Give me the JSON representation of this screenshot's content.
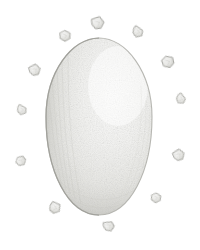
{
  "illustration": {
    "title": "Egg with scattered shell fragments",
    "medium": "pencil sketch",
    "background_color": "#ffffff",
    "caption": "",
    "subject_label": "egg",
    "fragments_label": "shell fragment"
  },
  "canvas": {
    "width": 200,
    "height": 250
  },
  "palette": {
    "background": "#ffffff",
    "egg_highlight": "#fcfcfb",
    "egg_midtone": "#e9e9e6",
    "egg_shadow": "#c9c9c5",
    "egg_outline": "#b3b3ae",
    "fragment_fill": "#ededea",
    "fragment_outline": "#a9a9a4",
    "texture_speckle": "#d6d6d2"
  },
  "egg": {
    "center_x": 99,
    "center_y": 127,
    "radius_x": 53,
    "radius_y": 89,
    "taper_top": 0.74,
    "light_direction": "upper-right",
    "outline_width": 1.1
  },
  "fragments": [
    {
      "id": "frag-top",
      "cx": 98,
      "cy": 23,
      "size": 11,
      "rot": -12,
      "shape": "chip-a"
    },
    {
      "id": "frag-top-right",
      "cx": 138,
      "cy": 32,
      "size": 10,
      "rot": 24,
      "shape": "chip-b"
    },
    {
      "id": "frag-right-upper",
      "cx": 168,
      "cy": 62,
      "size": 11,
      "rot": -8,
      "shape": "chip-c"
    },
    {
      "id": "frag-right",
      "cx": 181,
      "cy": 99,
      "size": 9,
      "rot": 40,
      "shape": "chip-b"
    },
    {
      "id": "frag-right-lower",
      "cx": 179,
      "cy": 155,
      "size": 10,
      "rot": -26,
      "shape": "chip-a"
    },
    {
      "id": "frag-bottom-right",
      "cx": 156,
      "cy": 198,
      "size": 9,
      "rot": 14,
      "shape": "chip-c"
    },
    {
      "id": "frag-bottom",
      "cx": 109,
      "cy": 226,
      "size": 10,
      "rot": -18,
      "shape": "chip-b"
    },
    {
      "id": "frag-bottom-left",
      "cx": 55,
      "cy": 208,
      "size": 10,
      "rot": 32,
      "shape": "chip-a"
    },
    {
      "id": "frag-left-lower",
      "cx": 21,
      "cy": 161,
      "size": 9,
      "rot": -34,
      "shape": "chip-c"
    },
    {
      "id": "frag-left",
      "cx": 22,
      "cy": 110,
      "size": 9,
      "rot": 18,
      "shape": "chip-b"
    },
    {
      "id": "frag-left-upper",
      "cx": 35,
      "cy": 70,
      "size": 10,
      "rot": -20,
      "shape": "chip-a"
    },
    {
      "id": "frag-top-left",
      "cx": 65,
      "cy": 36,
      "size": 10,
      "rot": 10,
      "shape": "chip-c"
    }
  ]
}
